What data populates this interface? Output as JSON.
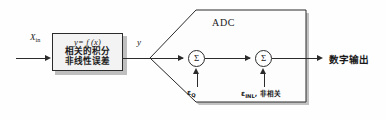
{
  "diagram": {
    "type": "block-diagram",
    "title_block": "ADC",
    "colors": {
      "line": "#2b2b2b",
      "box_fill": "#f3f3f3",
      "adc_fill": "#fdfdfd",
      "shadow": "#8a8a8a",
      "background": "#fefefe"
    },
    "input": {
      "label": "X",
      "label_subscript": "in",
      "arrow": "arrow-right-icon"
    },
    "transfer_block": {
      "equation": "y= f (x)",
      "line2": "相关的积分",
      "line3": "非线性误差"
    },
    "intermediate_signal": {
      "label": "y"
    },
    "adc": {
      "label": "ADC",
      "stages": [
        {
          "symbol": "Σ",
          "name": "quantization-summer",
          "error_input": {
            "symbol": "ε",
            "subscript": "Q",
            "note": ""
          }
        },
        {
          "symbol": "Σ",
          "name": "inl-summer",
          "error_input": {
            "symbol": "ε",
            "subscript": "INL",
            "note": ", 非相关"
          }
        }
      ]
    },
    "output": {
      "label": "数字输出",
      "arrow": "arrow-right-icon"
    }
  }
}
